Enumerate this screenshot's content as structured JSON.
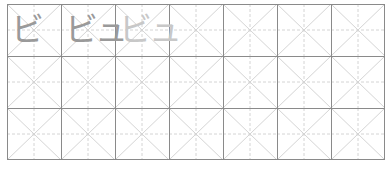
{
  "sheet": {
    "columns": 7,
    "rows": 3,
    "cell_width": 54,
    "cell_height": 52,
    "grid_color": "#8a8a8a",
    "guide_color": "#d4d4d4",
    "cells": [
      {
        "text": "ビ",
        "color": "#9a9a9a"
      },
      {
        "text": "ビュ",
        "color": "#9a9a9a"
      },
      {
        "text": "ビュ",
        "color": "#c8c8c8"
      }
    ]
  }
}
